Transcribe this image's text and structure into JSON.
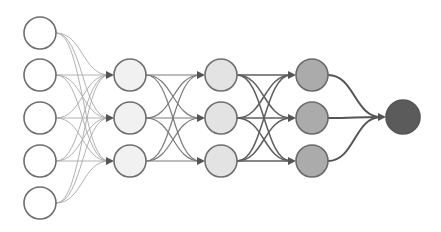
{
  "diagram": {
    "type": "feedforward-neural-network",
    "width": 441,
    "height": 232,
    "node_radius": 16,
    "layers": [
      {
        "name": "input",
        "x": 40,
        "ys": [
          33,
          75,
          118,
          161,
          203
        ],
        "fill": "#ffffff",
        "stroke": "#6e6e6e",
        "radius": 16
      },
      {
        "name": "hidden-1",
        "x": 130,
        "ys": [
          75,
          118,
          161
        ],
        "fill": "#f1f1f1",
        "stroke": "#6e6e6e",
        "radius": 16
      },
      {
        "name": "hidden-2",
        "x": 221,
        "ys": [
          75,
          118,
          161
        ],
        "fill": "#e3e3e3",
        "stroke": "#6e6e6e",
        "radius": 16
      },
      {
        "name": "hidden-3",
        "x": 312,
        "ys": [
          75,
          118,
          161
        ],
        "fill": "#ababab",
        "stroke": "#6a6a6a",
        "radius": 16
      },
      {
        "name": "output",
        "x": 403,
        "ys": [
          117
        ],
        "fill": "#5b5b5b",
        "stroke": "#555555",
        "radius": 17
      }
    ],
    "edge_styles": [
      {
        "from": "input",
        "to": "hidden-1",
        "color": "#a8a8a8",
        "width": 0.9
      },
      {
        "from": "hidden-1",
        "to": "hidden-2",
        "color": "#7a7a7a",
        "width": 1.2
      },
      {
        "from": "hidden-2",
        "to": "hidden-3",
        "color": "#5e5e5e",
        "width": 1.5
      },
      {
        "from": "hidden-3",
        "to": "output",
        "color": "#555555",
        "width": 2.0
      }
    ],
    "arrowhead_color": "#555555",
    "connectivity": "fully-connected"
  }
}
